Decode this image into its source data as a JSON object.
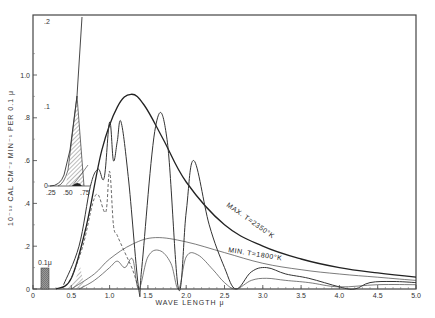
{
  "chart_data": {
    "type": "line",
    "title": "",
    "xlabel": "WAVE LENGTH μ",
    "ylabel": "10⁻¹² CAL CM⁻² MIN⁻¹ PER 0.1 μ",
    "xlim": [
      0,
      5.0
    ],
    "ylim": [
      0,
      1.2
    ],
    "grid": false,
    "x_ticks": [
      "0",
      "0.5",
      "1.0",
      "1.5",
      "2.0",
      "2.5",
      "3.0",
      "3.5",
      "4.0",
      "4.5",
      "5.0"
    ],
    "y_ticks": [
      "0",
      ".2",
      ".4",
      ".6",
      ".8",
      "1.0"
    ],
    "series": [
      {
        "name": "MAX. T=2350°K",
        "style": "solid-heavy",
        "x": [
          0.3,
          0.5,
          0.7,
          0.9,
          1.1,
          1.28,
          1.45,
          1.7,
          2.0,
          2.5,
          3.0,
          3.5,
          4.0,
          4.5,
          5.0
        ],
        "y": [
          0.0,
          0.05,
          0.3,
          0.65,
          0.85,
          0.91,
          0.86,
          0.7,
          0.5,
          0.3,
          0.2,
          0.14,
          0.1,
          0.075,
          0.055
        ]
      },
      {
        "name": "MIN. T=1800°K",
        "style": "solid-thin",
        "x": [
          0.5,
          0.8,
          1.0,
          1.3,
          1.6,
          2.0,
          2.5,
          3.0,
          3.5,
          4.0,
          4.5,
          5.0
        ],
        "y": [
          0.0,
          0.07,
          0.14,
          0.21,
          0.24,
          0.22,
          0.17,
          0.12,
          0.09,
          0.07,
          0.055,
          0.04
        ]
      },
      {
        "name": "Max attenuated (absorption bands)",
        "style": "solid",
        "x": [
          0.4,
          0.6,
          0.75,
          0.85,
          0.93,
          1.0,
          1.05,
          1.1,
          1.15,
          1.25,
          1.38,
          1.42,
          1.6,
          1.75,
          1.9,
          2.0,
          2.1,
          2.3,
          2.5,
          2.65,
          2.85,
          3.05,
          3.3,
          3.6,
          4.0,
          4.2,
          4.4,
          4.7,
          5.0
        ],
        "y": [
          0.02,
          0.2,
          0.48,
          0.56,
          0.52,
          0.78,
          0.6,
          0.69,
          0.78,
          0.5,
          0.0,
          0.1,
          0.76,
          0.7,
          0.0,
          0.36,
          0.6,
          0.3,
          0.1,
          0.0,
          0.08,
          0.1,
          0.07,
          0.05,
          0.01,
          0.0,
          0.03,
          0.035,
          0.03
        ]
      },
      {
        "name": "Min attenuated",
        "style": "solid-thin",
        "x": [
          0.6,
          0.8,
          1.0,
          1.1,
          1.2,
          1.3,
          1.38,
          1.5,
          1.65,
          1.8,
          1.9,
          2.0,
          2.15,
          2.35,
          2.5,
          2.65,
          2.85,
          3.05,
          3.3,
          3.6,
          4.0,
          4.5,
          5.0
        ],
        "y": [
          0.0,
          0.04,
          0.1,
          0.13,
          0.1,
          0.14,
          0.0,
          0.15,
          0.18,
          0.12,
          0.0,
          0.15,
          0.16,
          0.09,
          0.03,
          0.0,
          0.04,
          0.05,
          0.04,
          0.03,
          0.01,
          0.02,
          0.02
        ]
      },
      {
        "name": "Dashed (lower attenuation)",
        "style": "dashed",
        "x": [
          0.5,
          0.65,
          0.78,
          0.85,
          0.95,
          1.0,
          1.05,
          1.1,
          1.2,
          1.3,
          1.38
        ],
        "y": [
          0.05,
          0.2,
          0.4,
          0.44,
          0.36,
          0.55,
          0.3,
          0.25,
          0.17,
          0.09,
          0.0
        ]
      }
    ],
    "annotations": [
      {
        "text": "MAX. T=2350°K",
        "x": 3.0,
        "y": 0.32
      },
      {
        "text": "MIN. T=1800°K",
        "x": 3.0,
        "y": 0.17
      },
      {
        "text": "0.1μ",
        "x": 0.15,
        "y": 0.1,
        "note": "shaded reference bar width 0.1μ"
      }
    ],
    "inset": {
      "x_ticks": [
        ".25",
        ".50",
        ".75"
      ],
      "y_ticks": [
        "0",
        ".1",
        ".2"
      ],
      "description": "Magnified 0.25–0.75μ region with hatched area under curve"
    }
  },
  "labels": {
    "xlabel": "WAVE LENGTH μ",
    "ylabel": "10⁻¹² CAL CM⁻² MIN⁻¹ PER 0.1 μ",
    "max_curve": "MAX. T=2350°K",
    "min_curve": "MIN. T=1800°K",
    "bar_label": "0.1μ",
    "inset_y_top": ".2",
    "inset_y_mid": ".1",
    "inset_y_zero": "0",
    "inset_x_1": ".25",
    "inset_x_2": ".50",
    "inset_x_3": ".75"
  }
}
